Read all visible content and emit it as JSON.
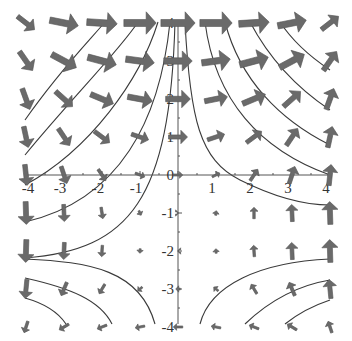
{
  "chart_data": {
    "type": "vector_field",
    "title": "",
    "xlabel": "",
    "ylabel": "",
    "xlim": [
      -4,
      4
    ],
    "ylim": [
      -4,
      4
    ],
    "grid": false,
    "legend": null,
    "x_ticks": [
      -4,
      -3,
      -2,
      -1,
      0,
      1,
      2,
      3,
      4
    ],
    "y_ticks": [
      -4,
      -3,
      -2,
      -1,
      0,
      1,
      2,
      3,
      4
    ],
    "x_tick_labels": [
      "-4",
      "-3",
      "-2",
      "-1",
      "0",
      "1",
      "2",
      "3",
      "4"
    ],
    "y_tick_labels": [
      "-4",
      "-3",
      "-2",
      "-1",
      "0",
      "1",
      "2",
      "3",
      "4"
    ],
    "arrow_color": "#6a6a6a",
    "streamline_color": "#3a3a3a",
    "arrows": [
      {
        "x": -4,
        "y": 4,
        "dx": 0.45,
        "dy": -0.35
      },
      {
        "x": -3,
        "y": 4,
        "dx": 0.75,
        "dy": -0.15
      },
      {
        "x": -2,
        "y": 4,
        "dx": 0.8,
        "dy": -0.05
      },
      {
        "x": -1,
        "y": 4,
        "dx": 0.85,
        "dy": 0
      },
      {
        "x": 0,
        "y": 4,
        "dx": 0.9,
        "dy": 0
      },
      {
        "x": 1,
        "y": 4,
        "dx": 0.85,
        "dy": 0
      },
      {
        "x": 2,
        "y": 4,
        "dx": 0.8,
        "dy": 0.05
      },
      {
        "x": 3,
        "y": 4,
        "dx": 0.75,
        "dy": 0.15
      },
      {
        "x": 4,
        "y": 4,
        "dx": 0.45,
        "dy": 0.35
      },
      {
        "x": -4,
        "y": 3,
        "dx": 0.35,
        "dy": -0.5
      },
      {
        "x": -3,
        "y": 3,
        "dx": 0.65,
        "dy": -0.35
      },
      {
        "x": -2,
        "y": 3,
        "dx": 0.75,
        "dy": -0.2
      },
      {
        "x": -1,
        "y": 3,
        "dx": 0.75,
        "dy": -0.1
      },
      {
        "x": 0,
        "y": 3,
        "dx": 0.75,
        "dy": 0
      },
      {
        "x": 1,
        "y": 3,
        "dx": 0.75,
        "dy": 0.1
      },
      {
        "x": 2,
        "y": 3,
        "dx": 0.75,
        "dy": 0.2
      },
      {
        "x": 3,
        "y": 3,
        "dx": 0.65,
        "dy": 0.35
      },
      {
        "x": 4,
        "y": 3,
        "dx": 0.35,
        "dy": 0.5
      },
      {
        "x": -4,
        "y": 2,
        "dx": 0.2,
        "dy": -0.55
      },
      {
        "x": -3,
        "y": 2,
        "dx": 0.45,
        "dy": -0.4
      },
      {
        "x": -2,
        "y": 2,
        "dx": 0.6,
        "dy": -0.25
      },
      {
        "x": -1,
        "y": 2,
        "dx": 0.65,
        "dy": -0.12
      },
      {
        "x": 0,
        "y": 2,
        "dx": 0.65,
        "dy": 0
      },
      {
        "x": 1,
        "y": 2,
        "dx": 0.6,
        "dy": 0.12
      },
      {
        "x": 2,
        "y": 2,
        "dx": 0.6,
        "dy": 0.25
      },
      {
        "x": 3,
        "y": 2,
        "dx": 0.45,
        "dy": 0.4
      },
      {
        "x": 4,
        "y": 2,
        "dx": 0.2,
        "dy": 0.55
      },
      {
        "x": -4,
        "y": 1,
        "dx": 0.12,
        "dy": -0.55
      },
      {
        "x": -3,
        "y": 1,
        "dx": 0.3,
        "dy": -0.45
      },
      {
        "x": -2,
        "y": 1,
        "dx": 0.4,
        "dy": -0.3
      },
      {
        "x": -1,
        "y": 1,
        "dx": 0.45,
        "dy": -0.15
      },
      {
        "x": 0,
        "y": 1,
        "dx": 0.5,
        "dy": 0
      },
      {
        "x": 1,
        "y": 1,
        "dx": 0.45,
        "dy": 0.15
      },
      {
        "x": 2,
        "y": 1,
        "dx": 0.4,
        "dy": 0.3
      },
      {
        "x": 3,
        "y": 1,
        "dx": 0.3,
        "dy": 0.45
      },
      {
        "x": 4,
        "y": 1,
        "dx": 0.12,
        "dy": 0.55
      },
      {
        "x": -4,
        "y": 0,
        "dx": 0.06,
        "dy": -0.55
      },
      {
        "x": -3,
        "y": 0,
        "dx": 0.15,
        "dy": -0.45
      },
      {
        "x": -2,
        "y": 0,
        "dx": 0.2,
        "dy": -0.3
      },
      {
        "x": -1,
        "y": 0,
        "dx": 0.25,
        "dy": -0.1
      },
      {
        "x": 0,
        "y": 0,
        "dx": 0.25,
        "dy": 0
      },
      {
        "x": 1,
        "y": 0,
        "dx": 0.2,
        "dy": 0.1
      },
      {
        "x": 2,
        "y": 0,
        "dx": 0.2,
        "dy": 0.3
      },
      {
        "x": 3,
        "y": 0,
        "dx": 0.15,
        "dy": 0.45
      },
      {
        "x": 4,
        "y": 0,
        "dx": 0.06,
        "dy": 0.55
      },
      {
        "x": -4,
        "y": -1,
        "dx": 0.02,
        "dy": -0.6
      },
      {
        "x": -3,
        "y": -1,
        "dx": 0.02,
        "dy": -0.45
      },
      {
        "x": -2,
        "y": -1,
        "dx": 0.05,
        "dy": -0.3
      },
      {
        "x": -1,
        "y": -1,
        "dx": 0.06,
        "dy": -0.12
      },
      {
        "x": 0,
        "y": -1,
        "dx": 0.03,
        "dy": 0
      },
      {
        "x": 1,
        "y": -1,
        "dx": 0.02,
        "dy": 0.12
      },
      {
        "x": 2,
        "y": -1,
        "dx": 0,
        "dy": 0.3
      },
      {
        "x": 3,
        "y": -1,
        "dx": -0.02,
        "dy": 0.45
      },
      {
        "x": 4,
        "y": -1,
        "dx": -0.02,
        "dy": 0.6
      },
      {
        "x": -4,
        "y": -2,
        "dx": -0.02,
        "dy": -0.6
      },
      {
        "x": -3,
        "y": -2,
        "dx": -0.02,
        "dy": -0.45
      },
      {
        "x": -2,
        "y": -2,
        "dx": -0.02,
        "dy": -0.3
      },
      {
        "x": -1,
        "y": -2,
        "dx": -0.01,
        "dy": -0.12
      },
      {
        "x": 0,
        "y": -2,
        "dx": -0.02,
        "dy": 0
      },
      {
        "x": 1,
        "y": -2,
        "dx": -0.01,
        "dy": 0.12
      },
      {
        "x": 2,
        "y": -2,
        "dx": -0.02,
        "dy": 0.3
      },
      {
        "x": 3,
        "y": -2,
        "dx": -0.02,
        "dy": 0.45
      },
      {
        "x": 4,
        "y": -2,
        "dx": -0.02,
        "dy": 0.6
      },
      {
        "x": -4,
        "y": -3,
        "dx": -0.05,
        "dy": -0.5
      },
      {
        "x": -3,
        "y": -3,
        "dx": -0.15,
        "dy": -0.35
      },
      {
        "x": -2,
        "y": -3,
        "dx": -0.15,
        "dy": -0.25
      },
      {
        "x": -1,
        "y": -3,
        "dx": -0.12,
        "dy": -0.1
      },
      {
        "x": 0,
        "y": -3,
        "dx": -0.12,
        "dy": 0
      },
      {
        "x": 1,
        "y": -3,
        "dx": -0.12,
        "dy": 0.1
      },
      {
        "x": 2,
        "y": -3,
        "dx": -0.15,
        "dy": 0.25
      },
      {
        "x": 3,
        "y": -3,
        "dx": -0.15,
        "dy": 0.35
      },
      {
        "x": 4,
        "y": -3,
        "dx": -0.05,
        "dy": 0.5
      },
      {
        "x": -4,
        "y": -4,
        "dx": -0.1,
        "dy": -0.3
      },
      {
        "x": -3,
        "y": -4,
        "dx": -0.25,
        "dy": -0.15
      },
      {
        "x": -2,
        "y": -4,
        "dx": -0.25,
        "dy": -0.1
      },
      {
        "x": -1,
        "y": -4,
        "dx": -0.25,
        "dy": -0.05
      },
      {
        "x": 0,
        "y": -4,
        "dx": -0.25,
        "dy": 0
      },
      {
        "x": 1,
        "y": -4,
        "dx": -0.25,
        "dy": 0.05
      },
      {
        "x": 2,
        "y": -4,
        "dx": -0.25,
        "dy": 0.1
      },
      {
        "x": 3,
        "y": -4,
        "dx": -0.25,
        "dy": 0.15
      },
      {
        "x": 4,
        "y": -4,
        "dx": -0.1,
        "dy": 0.3
      }
    ],
    "streamlines": [
      "M 25 120 C 60 70, 90 40, 105 22",
      "M 25 155 C 70 100, 120 50, 138 22",
      "M 25 185 C 90 150, 140 80, 158 22",
      "M 25 222 C 120 200, 160 120, 170 22",
      "M 25 258 C 130 250, 170 200, 175 22",
      "M 185 22 C 190 120, 200 160, 240 180 C 280 200, 310 205, 330 205",
      "M 205 22 C 215 100, 260 150, 330 175",
      "M 225 22 C 240 80, 280 120, 330 145",
      "M 250 22 C 270 60, 300 90, 330 110",
      "M 280 22 C 295 45, 315 60, 330 70",
      "M 25 259 C 90 262, 140 270, 155 324",
      "M 25 278 C 70 288, 100 300, 112 324",
      "M 25 298 C 50 305, 60 315, 66 324",
      "M 200 324 C 210 285, 260 262, 330 259",
      "M 245 324 C 270 300, 300 285, 330 280",
      "M 285 324 C 300 312, 315 305, 330 300"
    ],
    "plot_area_px": {
      "x0": 25,
      "x1": 330,
      "y0": 22,
      "y1": 324,
      "origin_x": 178,
      "origin_y": 175,
      "unit": 38
    }
  }
}
